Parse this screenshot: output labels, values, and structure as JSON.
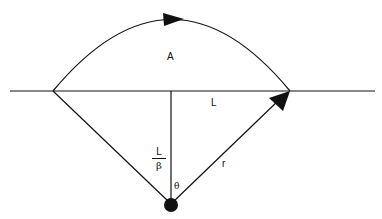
{
  "diagram": {
    "labels": {
      "area": "A",
      "chord": "L",
      "height_numerator": "L",
      "height_denominator": "β",
      "radius": "r",
      "angle": "θ"
    },
    "colors": {
      "stroke": "#111111",
      "background": "#ffffff"
    },
    "elements": [
      "baseline",
      "arc-with-arrow",
      "chord",
      "vertical-height-line",
      "left-radius-line",
      "right-radius-arrow",
      "center-point"
    ]
  }
}
